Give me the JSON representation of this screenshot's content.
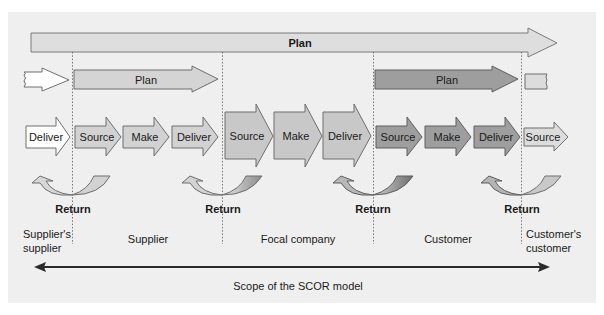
{
  "diagram": {
    "top_plan": {
      "label": "Plan"
    },
    "plan_rows": [
      {
        "label": "Plan",
        "entity": "supplier"
      },
      {
        "label": "Plan",
        "entity": "customer"
      }
    ],
    "process_arrows": {
      "suppliers_supplier": [
        {
          "label": "Deliver"
        }
      ],
      "supplier": [
        {
          "label": "Source"
        },
        {
          "label": "Make"
        },
        {
          "label": "Deliver"
        }
      ],
      "focal_company": [
        {
          "label": "Source"
        },
        {
          "label": "Make"
        },
        {
          "label": "Deliver"
        }
      ],
      "customer": [
        {
          "label": "Source"
        },
        {
          "label": "Make"
        },
        {
          "label": "Deliver"
        }
      ],
      "customers_customer": [
        {
          "label": "Source"
        }
      ]
    },
    "returns": [
      {
        "label": "Return"
      },
      {
        "label": "Return"
      },
      {
        "label": "Return"
      },
      {
        "label": "Return"
      }
    ],
    "entities": [
      {
        "label_line1": "Supplier's",
        "label_line2": "supplier"
      },
      {
        "label": "Supplier"
      },
      {
        "label": "Focal company"
      },
      {
        "label": "Customer"
      },
      {
        "label_line1": "Customer's",
        "label_line2": "customer"
      }
    ],
    "scope": {
      "label": "Scope of the SCOR model"
    },
    "colors": {
      "panel_bg": "#efefef",
      "light_fill": "#e3e3e3",
      "supplier_fill": "#d2d2d2",
      "focal_fill": "#c8c8c8",
      "customer_fill": "#9e9e9e",
      "outline": "#6e6e6e",
      "white_fill": "#ffffff",
      "scope_arrow": "#2a2a2a"
    }
  }
}
